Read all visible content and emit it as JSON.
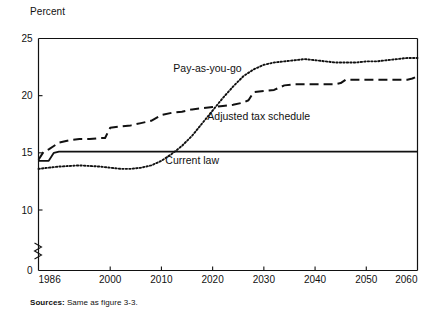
{
  "figure": {
    "y_axis_title": "Percent",
    "source_label": "Sources:",
    "source_text": "Same as figure 3-3."
  },
  "chart_data": {
    "type": "line",
    "title": "",
    "subtitle": "",
    "xlabel": "",
    "ylabel": "Percent",
    "xlim": [
      1986,
      2060
    ],
    "ylim": [
      0,
      25
    ],
    "y_axis_break": true,
    "y_axis_break_between": [
      0,
      10
    ],
    "grid": false,
    "legend": "inline-annotations",
    "xticks": [
      1986,
      2000,
      2010,
      2020,
      2030,
      2040,
      2050,
      2060
    ],
    "xtick_labels": [
      "1986",
      "2000",
      "2010",
      "2020",
      "2030",
      "2040",
      "2050",
      "2060"
    ],
    "yticks": [
      0,
      10,
      15,
      20,
      25
    ],
    "ytick_labels": [
      "0",
      "10",
      "15",
      "20",
      "25"
    ],
    "series": [
      {
        "name": "Current law",
        "style": "solid",
        "label_x": 2016,
        "label_y": 14.3,
        "x": [
          1986,
          1988,
          1989,
          1990,
          1991,
          1995,
          2000,
          2010,
          2020,
          2030,
          2040,
          2050,
          2060
        ],
        "values": [
          14.3,
          14.3,
          15.0,
          15.1,
          15.1,
          15.1,
          15.1,
          15.1,
          15.1,
          15.1,
          15.1,
          15.1,
          15.1
        ]
      },
      {
        "name": "Adjusted tax schedule",
        "style": "dashed",
        "label_x": 2029,
        "label_y": 18.2,
        "x": [
          1986,
          1987,
          1988,
          1989,
          1990,
          1992,
          1994,
          1996,
          1998,
          1999,
          2000,
          2002,
          2004,
          2006,
          2008,
          2010,
          2012,
          2014,
          2016,
          2018,
          2020,
          2022,
          2024,
          2026,
          2027,
          2028,
          2030,
          2032,
          2034,
          2036,
          2038,
          2040,
          2042,
          2044,
          2045,
          2046,
          2048,
          2050,
          2054,
          2058,
          2059,
          2060
        ],
        "values": [
          14.4,
          15.1,
          15.3,
          15.6,
          15.9,
          16.1,
          16.2,
          16.2,
          16.3,
          16.3,
          17.2,
          17.3,
          17.4,
          17.6,
          17.8,
          18.3,
          18.5,
          18.6,
          18.8,
          18.9,
          19.0,
          19.1,
          19.2,
          19.4,
          19.6,
          20.3,
          20.4,
          20.5,
          20.9,
          21.0,
          21.0,
          21.0,
          21.0,
          21.0,
          21.1,
          21.4,
          21.4,
          21.4,
          21.4,
          21.4,
          21.5,
          21.7
        ]
      },
      {
        "name": "Pay-as-you-go",
        "style": "dotted",
        "label_x": 2019,
        "label_y": 22.4,
        "x": [
          1986,
          1990,
          1994,
          1998,
          2000,
          2002,
          2004,
          2006,
          2008,
          2010,
          2012,
          2014,
          2016,
          2018,
          2020,
          2022,
          2024,
          2026,
          2028,
          2030,
          2032,
          2034,
          2036,
          2038,
          2040,
          2042,
          2044,
          2046,
          2048,
          2050,
          2052,
          2054,
          2056,
          2058,
          2060
        ],
        "values": [
          13.6,
          13.8,
          13.9,
          13.8,
          13.7,
          13.6,
          13.6,
          13.7,
          13.9,
          14.3,
          14.9,
          15.6,
          16.5,
          17.6,
          18.7,
          19.8,
          20.8,
          21.7,
          22.3,
          22.7,
          22.9,
          23.0,
          23.1,
          23.2,
          23.1,
          23.0,
          22.9,
          22.9,
          22.9,
          23.0,
          23.0,
          23.1,
          23.2,
          23.3,
          23.3
        ]
      }
    ]
  }
}
